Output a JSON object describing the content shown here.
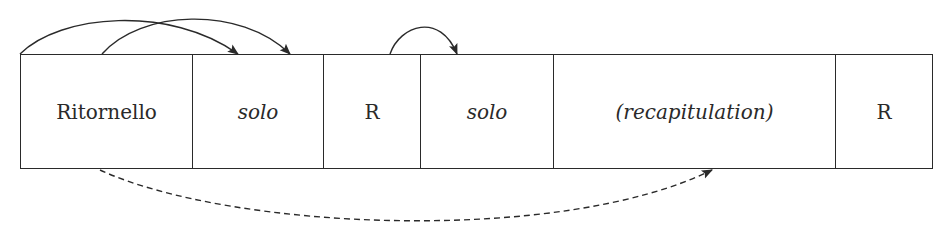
{
  "diagram": {
    "sections": [
      {
        "label": "Ritornello",
        "italic": false,
        "x": 20,
        "width": 172
      },
      {
        "label": "solo",
        "italic": true,
        "x": 192,
        "width": 131
      },
      {
        "label": "R",
        "italic": false,
        "x": 323,
        "width": 97
      },
      {
        "label": "solo",
        "italic": true,
        "x": 420,
        "width": 133
      },
      {
        "label": "(recapitulation)",
        "italic": true,
        "x": 553,
        "width": 282
      },
      {
        "label": "R",
        "italic": false,
        "x": 835,
        "width": 98
      }
    ],
    "arrows": [
      {
        "from_x": 20,
        "to_x": 238,
        "side": "top",
        "style": "solid"
      },
      {
        "from_x": 102,
        "to_x": 290,
        "side": "top",
        "style": "solid"
      },
      {
        "from_x": 390,
        "to_x": 457,
        "side": "top",
        "style": "solid"
      },
      {
        "from_x": 100,
        "to_x": 712,
        "side": "bottom",
        "style": "dashed"
      }
    ],
    "colors": {
      "line": "#2a2a2a",
      "background": "#ffffff"
    }
  }
}
